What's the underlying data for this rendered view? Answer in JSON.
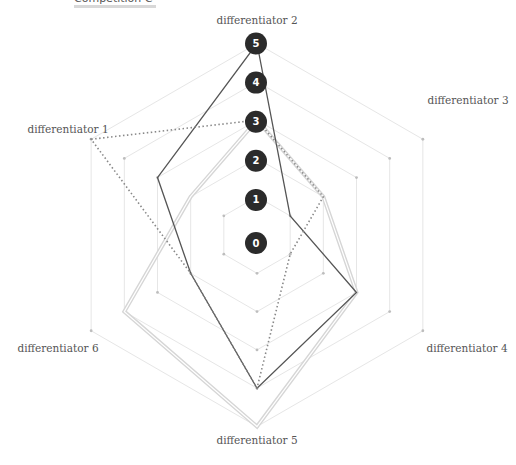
{
  "legend": {
    "label": "Competition C",
    "swatch_color": "#d8d8d8"
  },
  "chart_data": {
    "type": "radar",
    "title": "",
    "axes": [
      "differentiator 1",
      "differentiator 2",
      "differentiator 3",
      "differentiator 4",
      "differentiator 5",
      "differentiator 6"
    ],
    "scale": {
      "min": 0,
      "max": 5,
      "ticks": [
        0,
        1,
        2,
        3,
        4,
        5
      ]
    },
    "series": [
      {
        "name": "Competition C",
        "style": "double-light",
        "color": "#d6d6d6",
        "values": [
          2,
          3,
          2,
          3,
          5,
          4
        ]
      },
      {
        "name": "Series dark",
        "style": "solid",
        "color": "#555555",
        "values": [
          3,
          5,
          1,
          3,
          4,
          2
        ]
      },
      {
        "name": "Series dotted",
        "style": "dotted",
        "color": "#888888",
        "values": [
          5,
          3,
          2,
          1,
          4,
          2
        ]
      }
    ],
    "grid": true,
    "legend_position": "top-left"
  },
  "geometry": {
    "cx": 257,
    "cy": 235,
    "step": 38.3
  },
  "colors": {
    "grid": "#e6e6e6",
    "grid_dot": "#bdbdbd",
    "tick_bg": "#2b2b2b"
  }
}
